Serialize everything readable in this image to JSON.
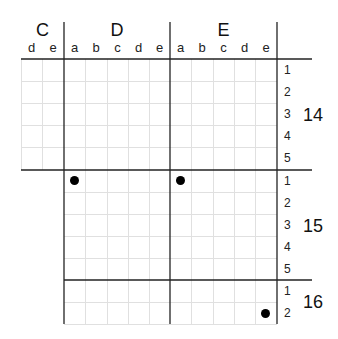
{
  "grid": {
    "major_columns": [
      {
        "label": "C",
        "sub": [
          "d",
          "e"
        ]
      },
      {
        "label": "D",
        "sub": [
          "a",
          "b",
          "c",
          "d",
          "e"
        ]
      },
      {
        "label": "E",
        "sub": [
          "a",
          "b",
          "c",
          "d",
          "e"
        ]
      }
    ],
    "major_rows": [
      {
        "label": "14",
        "sub": [
          "1",
          "2",
          "3",
          "4",
          "5"
        ]
      },
      {
        "label": "15",
        "sub": [
          "1",
          "2",
          "3",
          "4",
          "5"
        ]
      },
      {
        "label": "16",
        "sub": [
          "1",
          "2"
        ]
      }
    ],
    "dots": [
      {
        "column": "D-a",
        "row": "15-1"
      },
      {
        "column": "E-a",
        "row": "15-1"
      },
      {
        "column": "E-e",
        "row": "16-2"
      }
    ],
    "colors": {
      "minor_line": "#e2e2e2",
      "major_line": "#222222",
      "dot": "#000000"
    }
  }
}
